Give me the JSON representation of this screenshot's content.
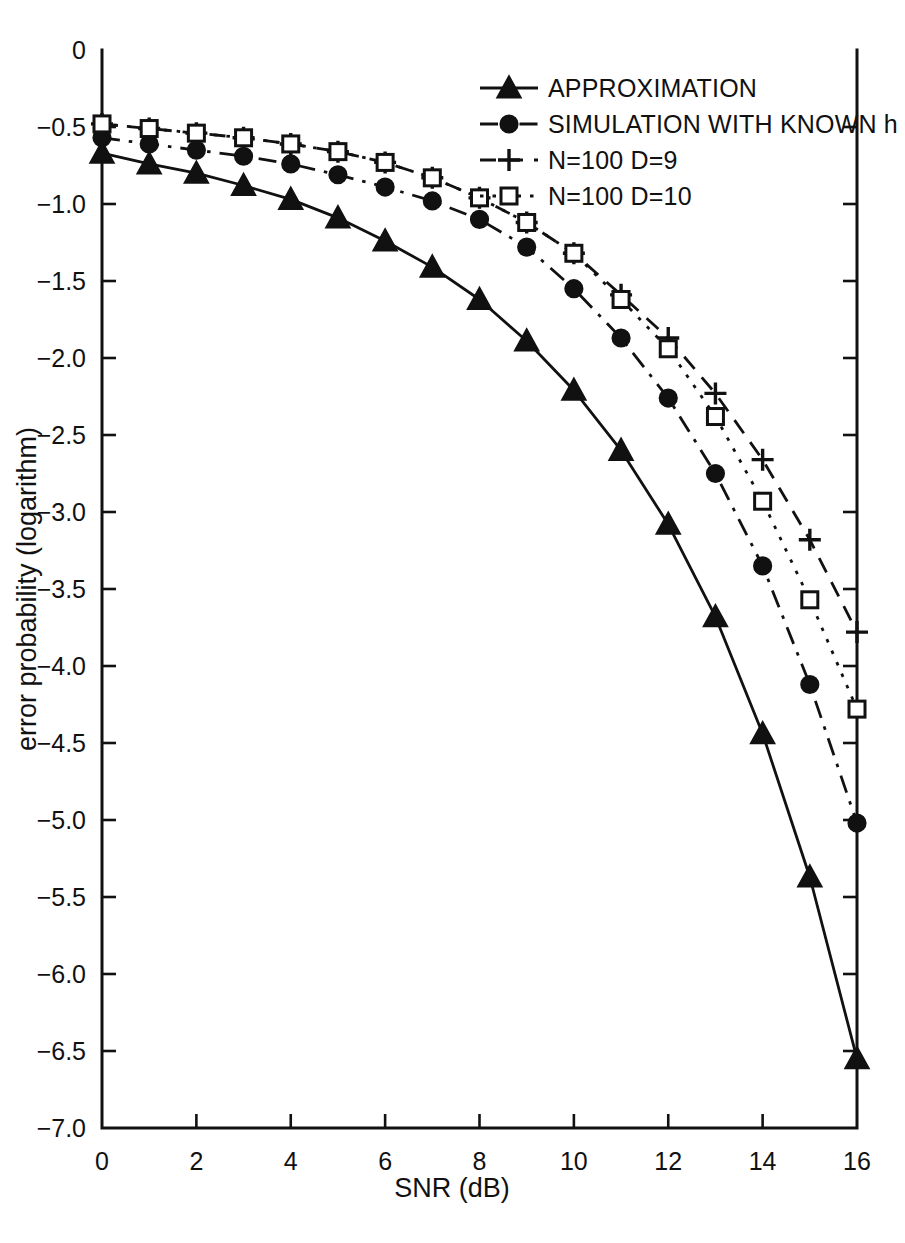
{
  "chart_data": {
    "type": "line",
    "title": "",
    "xlabel": "SNR (dB)",
    "ylabel": "error probability (logarithm)",
    "xlim": [
      0,
      16
    ],
    "ylim": [
      -7.0,
      0
    ],
    "xticks": [
      0,
      2,
      4,
      6,
      8,
      10,
      12,
      14,
      16
    ],
    "xticklabels": [
      "0",
      "2",
      "4",
      "6",
      "8",
      "10",
      "12",
      "14",
      "16"
    ],
    "yticks": [
      0,
      -0.5,
      -1.0,
      -1.5,
      -2.0,
      -2.5,
      -3.0,
      -3.5,
      -4.0,
      -4.5,
      -5.0,
      -5.5,
      -6.0,
      -6.5,
      -7.0
    ],
    "yticklabels": [
      "0",
      "-0.5",
      "-1.0",
      "-1.5",
      "-2.0",
      "-2.5",
      "-3.0",
      "-3.5",
      "-4.0",
      "-4.5",
      "-5.0",
      "-5.5",
      "-6.0",
      "-6.5",
      "-7.0"
    ],
    "grid": false,
    "legend_position": "upper right inside",
    "x": [
      0,
      1,
      2,
      3,
      4,
      5,
      6,
      7,
      8,
      9,
      10,
      11,
      12,
      13,
      14,
      15,
      16
    ],
    "series": [
      {
        "name": "APPROXIMATION",
        "linestyle": "solid",
        "marker": "filled-triangle",
        "color": "#111111",
        "values": [
          -0.67,
          -0.74,
          -0.8,
          -0.88,
          -0.97,
          -1.09,
          -1.24,
          -1.41,
          -1.62,
          -1.89,
          -2.21,
          -2.6,
          -3.08,
          -3.68,
          -4.44,
          -5.37,
          -6.55
        ]
      },
      {
        "name": "SIMULATION WITH KNOWN h",
        "linestyle": "dash-dot",
        "marker": "filled-circle",
        "color": "#111111",
        "values": [
          -0.57,
          -0.61,
          -0.65,
          -0.69,
          -0.74,
          -0.81,
          -0.89,
          -0.98,
          -1.1,
          -1.28,
          -1.5,
          -1.77,
          -2.1,
          -2.5,
          -3.0,
          -3.62,
          -4.32
        ]
      },
      {
        "name": "N=100 D=9",
        "linestyle": "dashed",
        "marker": "plus",
        "color": "#111111",
        "values": [
          -0.48,
          -0.51,
          -0.54,
          -0.57,
          -0.61,
          -0.66,
          -0.73,
          -0.83,
          -0.96,
          -1.12,
          -1.32,
          -1.59,
          -1.89,
          -2.26,
          -2.71,
          -3.25,
          -3.88
        ]
      },
      {
        "name": "N=100 D=10",
        "linestyle": "dotted",
        "marker": "open-square",
        "color": "#111111",
        "values": [
          -0.48,
          -0.51,
          -0.54,
          -0.57,
          -0.61,
          -0.66,
          -0.73,
          -0.83,
          -0.96,
          -1.12,
          -1.32,
          -1.59,
          -1.89,
          -2.26,
          -2.71,
          -3.25,
          -3.88
        ]
      }
    ],
    "plotted_series_overrides": {
      "note": "markers are drawn at integer SNR values for APPROXIMATION; other series markers appear at sampled SNR points"
    }
  },
  "legend": {
    "entries": [
      {
        "label": "APPROXIMATION",
        "marker": "filled-triangle",
        "linestyle": "solid"
      },
      {
        "label": "SIMULATION WITH KNOWN h",
        "marker": "filled-circle",
        "linestyle": "dash-dot"
      },
      {
        "label": "N=100 D=9",
        "marker": "plus",
        "linestyle": "dashed"
      },
      {
        "label": "N=100 D=10",
        "marker": "open-square",
        "linestyle": "dotted"
      }
    ]
  },
  "axes": {
    "x_title": "SNR (dB)",
    "y_title": "error probability (logarithm)"
  }
}
